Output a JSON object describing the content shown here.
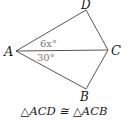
{
  "diagram": {
    "vertices": {
      "A": {
        "label": "A",
        "x": 16,
        "y": 51
      },
      "B": {
        "label": "B",
        "x": 86,
        "y": 89
      },
      "C": {
        "label": "C",
        "x": 108,
        "y": 50
      },
      "D": {
        "label": "D",
        "x": 86,
        "y": 10
      }
    },
    "segments": [
      "AD",
      "DC",
      "AC",
      "AB",
      "BC"
    ],
    "angle_labels": {
      "DAC": "6x°",
      "CAB": "30°"
    },
    "caption": "△ACD ≅ △ACB",
    "colors": {
      "lines": "#444444",
      "labels": "#1a1a1a",
      "angle_text": "#777777"
    }
  }
}
